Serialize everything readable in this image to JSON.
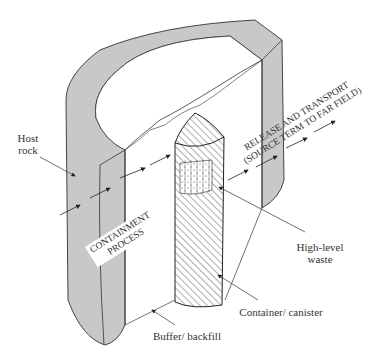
{
  "figure": {
    "type": "cutaway schematic of a geological repository for high-level nuclear waste",
    "colors": {
      "host_rock_fill": "#c8c8c8",
      "line": "#333333",
      "background": "#ffffff"
    }
  },
  "labels": {
    "host_rock": [
      "Host",
      "rock"
    ],
    "containment_process": [
      "CONTAINMENT",
      "PROCESS"
    ],
    "release_transport": [
      "RELEASE AND TRANSPORT",
      "(SOURCE TERM TO FAR FIELD)"
    ],
    "high_level_waste": [
      "High-level",
      "waste"
    ],
    "container_canister": "Container/ canister",
    "buffer_backfill": "Buffer/ backfill"
  },
  "components": [
    {
      "name": "Host rock",
      "style": "gray shaded wall"
    },
    {
      "name": "Buffer/ backfill",
      "style": "white fill"
    },
    {
      "name": "Container/ canister",
      "style": "diagonal hatching"
    },
    {
      "name": "High-level waste",
      "style": "dotted fill"
    }
  ],
  "arrows": {
    "containment_direction": "inward toward canister",
    "release_direction": "outward to far field"
  }
}
